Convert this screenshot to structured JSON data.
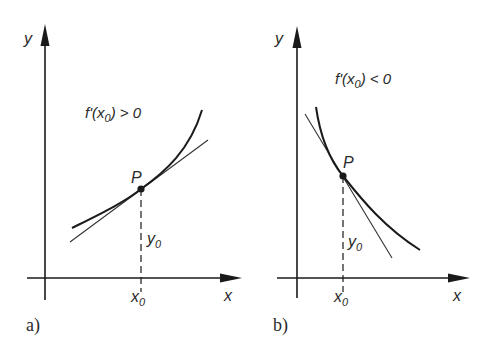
{
  "panels": [
    {
      "id": "a",
      "panel_label": "a)",
      "y_axis_label": "y",
      "x_axis_label": "x",
      "condition_label": "f'(x",
      "condition_sub": "0",
      "condition_rest": ") > 0",
      "point_label": "P",
      "y0_label": "y",
      "y0_sub": "0",
      "x0_label": "x",
      "x0_sub": "0",
      "description": "Increasing function: tangent at P has positive slope"
    },
    {
      "id": "b",
      "panel_label": "b)",
      "y_axis_label": "y",
      "x_axis_label": "x",
      "condition_label": "f'(x",
      "condition_sub": "0",
      "condition_rest": ") < 0",
      "point_label": "P",
      "y0_label": "y",
      "y0_sub": "0",
      "x0_label": "x",
      "x0_sub": "0",
      "description": "Decreasing function: tangent at P has negative slope"
    }
  ],
  "colors": {
    "stroke": "#1a1a1a",
    "text": "#2a2a2a",
    "background": "#ffffff"
  }
}
